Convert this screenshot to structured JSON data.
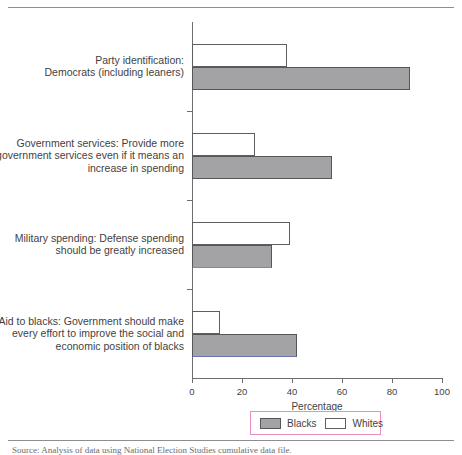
{
  "chart_data": {
    "type": "bar",
    "orientation": "horizontal",
    "title": "",
    "xlabel": "Percentage",
    "ylabel": "",
    "xlim": [
      0,
      100
    ],
    "xticks": [
      0,
      20,
      40,
      60,
      80,
      100
    ],
    "xticklabels": [
      "0",
      "20",
      "40",
      "60",
      "80",
      "100"
    ],
    "grid": false,
    "legend_position": "bottom-center",
    "categories": [
      "Party identification: Democrats (including leaners)",
      "Government services: Provide more government services even if it means an increase in spending",
      "Military spending: Defense spending should be greatly increased",
      "Aid to blacks: Government should make every effort to improve the social and economic position of blacks"
    ],
    "category_lines": [
      [
        "Party identification:",
        "Democrats (including leaners)"
      ],
      [
        "Government services: Provide more",
        "government services even if it means an",
        "increase in spending"
      ],
      [
        "Military spending: Defense spending",
        "should be greatly increased"
      ],
      [
        "Aid to blacks: Government should make",
        "every effort to improve the social and",
        "economic position of blacks"
      ]
    ],
    "series": [
      {
        "name": "Whites",
        "color": "#ffffff",
        "edge": "#5e5e62",
        "values": [
          38,
          25,
          39,
          11
        ]
      },
      {
        "name": "Blacks",
        "color": "#a3a3a5",
        "edge": "#55555a",
        "values": [
          87,
          56,
          32,
          42
        ]
      }
    ]
  },
  "legend": {
    "entries": [
      {
        "label": "Blacks",
        "swatch": "gray"
      },
      {
        "label": "Whites",
        "swatch": "white"
      }
    ],
    "border_color": "#e88ec0"
  },
  "axis": {
    "x_label": "Percentage",
    "tick_labels": [
      "0",
      "20",
      "40",
      "60",
      "80",
      "100"
    ]
  },
  "caption": "Source: Analysis of data using National Election Studies cumulative data file."
}
